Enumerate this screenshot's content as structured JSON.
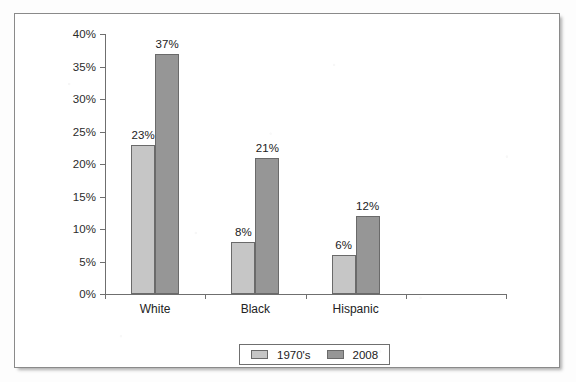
{
  "chart_data": {
    "type": "bar",
    "title": "",
    "xlabel": "",
    "ylabel": "",
    "categories": [
      "White",
      "Black",
      "Hispanic",
      ""
    ],
    "series": [
      {
        "name": "1970's",
        "values": [
          23,
          8,
          6,
          null
        ],
        "color": "#c6c6c6"
      },
      {
        "name": "2008",
        "values": [
          37,
          21,
          12,
          null
        ],
        "color": "#969696"
      }
    ],
    "value_labels": {
      "1970's": [
        "23%",
        "8%",
        "6%",
        ""
      ],
      "2008": [
        "37%",
        "21%",
        "12%",
        ""
      ]
    },
    "ylim": [
      0,
      40
    ],
    "ytick_step": 5,
    "ytick_labels": [
      "0%",
      "5%",
      "10%",
      "15%",
      "20%",
      "25%",
      "30%",
      "35%",
      "40%"
    ],
    "ytick_values": [
      0,
      5,
      10,
      15,
      20,
      25,
      30,
      35,
      40
    ],
    "grid": false,
    "legend_position": "bottom-center",
    "legend_entries": [
      "1970's",
      "2008"
    ],
    "value_suffix": "%"
  }
}
